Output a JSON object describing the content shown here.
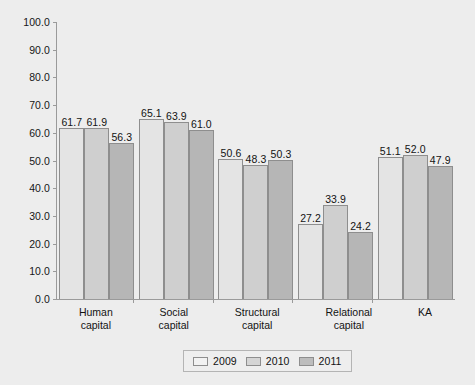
{
  "chart_data": {
    "type": "bar",
    "title": "",
    "xlabel": "",
    "ylabel": "",
    "ylim": [
      0,
      100
    ],
    "ytick_step": 10,
    "yticks": [
      "100.0",
      "90.0",
      "80.0",
      "70.0",
      "60.0",
      "50.0",
      "40.0",
      "30.0",
      "20.0",
      "10.0",
      "0.0"
    ],
    "grid": false,
    "legend_position": "bottom-center",
    "categories": [
      "Human\ncapital",
      "Social\ncapital",
      "Structural\ncapital",
      "Relational\ncapital",
      "KA"
    ],
    "series": [
      {
        "name": "2009",
        "color": "#e4e4e4",
        "values": [
          61.7,
          65.1,
          50.6,
          27.2,
          51.1
        ],
        "labels": [
          "61.7",
          "65.1",
          "50.6",
          "27.2",
          "51.1"
        ]
      },
      {
        "name": "2010",
        "color": "#cfcfcf",
        "values": [
          61.9,
          63.9,
          48.3,
          33.9,
          52.0
        ],
        "labels": [
          "61.9",
          "63.9",
          "48.3",
          "33.9",
          "52.0"
        ]
      },
      {
        "name": "2011",
        "color": "#b6b6b6",
        "values": [
          56.3,
          61.0,
          50.3,
          24.2,
          47.9
        ],
        "labels": [
          "56.3",
          "61.0",
          "50.3",
          "24.2",
          "47.9"
        ]
      }
    ]
  },
  "legend": {
    "items": [
      {
        "label": "2009"
      },
      {
        "label": "2010"
      },
      {
        "label": "2011"
      }
    ]
  }
}
